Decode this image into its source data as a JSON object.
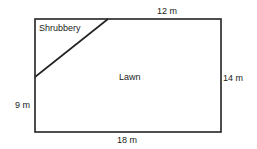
{
  "diagram": {
    "regions": {
      "shrubbery": "Shrubbery",
      "lawn": "Lawn"
    },
    "dimensions": {
      "top": "12 m",
      "right": "14 m",
      "left": "9 m",
      "bottom": "18 m"
    }
  }
}
